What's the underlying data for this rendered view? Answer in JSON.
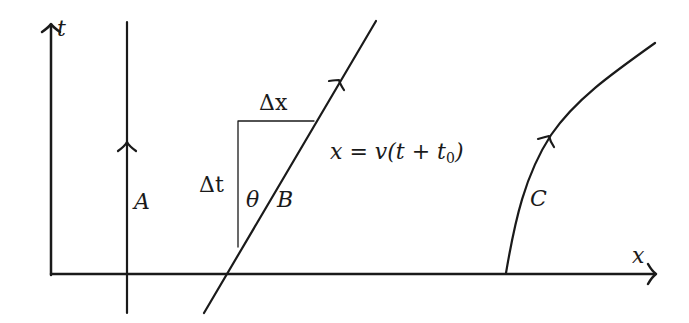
{
  "diagram": {
    "colors": {
      "stroke": "#1a1a1a",
      "background": "#ffffff"
    },
    "axes": {
      "t_label": "t",
      "x_label": "x"
    },
    "worldlines": [
      {
        "id": "A",
        "label": "A",
        "type": "vertical line (at rest)"
      },
      {
        "id": "B",
        "label": "B",
        "type": "straight line (constant velocity)",
        "equation": "x = v(t + t",
        "equation_sub": "0",
        "equation_close": ")"
      },
      {
        "id": "C",
        "label": "C",
        "type": "curve (accelerating)"
      }
    ],
    "triangle": {
      "delta_x": "Δx",
      "delta_t": "Δt",
      "angle": "θ"
    }
  }
}
